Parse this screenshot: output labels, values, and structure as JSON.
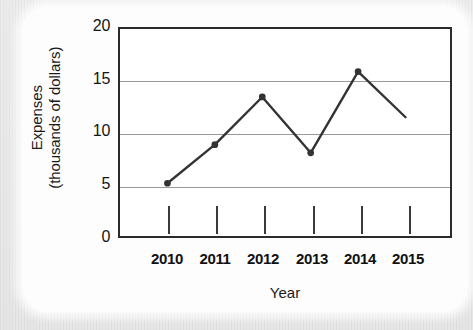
{
  "chart_data": {
    "type": "line",
    "title": "",
    "xlabel": "Year",
    "ylabel": "Expenses (thousands of dollars)",
    "ylabel_line1": "Expenses",
    "ylabel_line2": "(thousands of dollars)",
    "categories": [
      "2010",
      "2011",
      "2012",
      "2013",
      "2014",
      "2015"
    ],
    "x": [
      2010,
      2011,
      2012,
      2013,
      2014,
      2015
    ],
    "values": [
      5.0,
      8.8,
      13.5,
      8.0,
      16.0,
      11.5
    ],
    "series": [
      {
        "name": "Expenses",
        "values": [
          5.0,
          8.8,
          13.5,
          8.0,
          16.0,
          11.5
        ]
      }
    ],
    "y_tick_labels": [
      "20",
      "15",
      "10",
      "5",
      "0"
    ],
    "y_ticks": [
      20,
      15,
      10,
      5,
      0
    ],
    "ylim": [
      0,
      20
    ],
    "xlim": [
      "2010",
      "2015"
    ],
    "grid": "horizontal",
    "legend": "none",
    "marker": "filled-circle",
    "markers_shown": [
      true,
      true,
      true,
      true,
      true,
      false
    ],
    "line_color": "#333333",
    "grid_color": "#9a9a9a",
    "axis_color": "#2b2b2b",
    "plot_background": "#ffffff",
    "card_background": "#fdfdfd",
    "page_background": "#e9e9e9"
  }
}
